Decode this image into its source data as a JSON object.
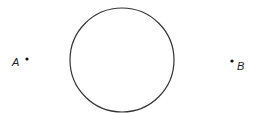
{
  "diagram": {
    "circle": {
      "cx": 122,
      "cy": 60,
      "r": 52,
      "stroke": "#333333"
    },
    "points": [
      {
        "label": "A",
        "x": 27,
        "y": 59,
        "label_x": 12,
        "label_y": 66
      },
      {
        "label": "B",
        "x": 232,
        "y": 61,
        "label_x": 237,
        "label_y": 70
      }
    ]
  }
}
